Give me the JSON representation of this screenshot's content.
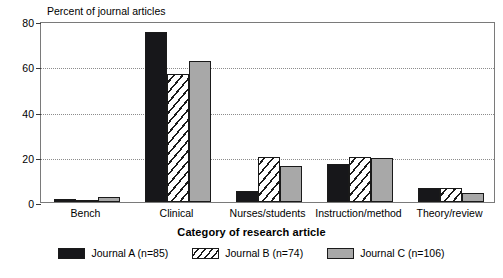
{
  "chart_data": {
    "type": "bar",
    "title": "",
    "ylabel": "Percent of journal articles",
    "xlabel": "Category of research article",
    "categories": [
      "Bench",
      "Clinical",
      "Nurses/students",
      "Instruction/method",
      "Theory/review"
    ],
    "series": [
      {
        "name": "Journal A (n=85)",
        "values": [
          1.5,
          75,
          5,
          17,
          6
        ],
        "color": "#17171a",
        "pattern": "solid-black"
      },
      {
        "name": "Journal B (n=74)",
        "values": [
          0.4,
          56.5,
          20,
          20,
          6
        ],
        "color": "#ffffff",
        "pattern": "diagonal-hatch"
      },
      {
        "name": "Journal C (n=106)",
        "values": [
          2,
          62.5,
          16,
          19.5,
          4
        ],
        "color": "#a8a8a8",
        "pattern": "solid-gray"
      }
    ],
    "ylim": [
      0,
      80
    ],
    "yticks": [
      0,
      20,
      40,
      60,
      80
    ],
    "ytick_labels": [
      "0",
      "20",
      "40",
      "60",
      "80"
    ],
    "grid": true,
    "grid_style": "dotted",
    "legend_position": "bottom-center",
    "legend": [
      "Journal A (n=85)",
      "Journal B (n=74)",
      "Journal C (n=106)"
    ]
  }
}
